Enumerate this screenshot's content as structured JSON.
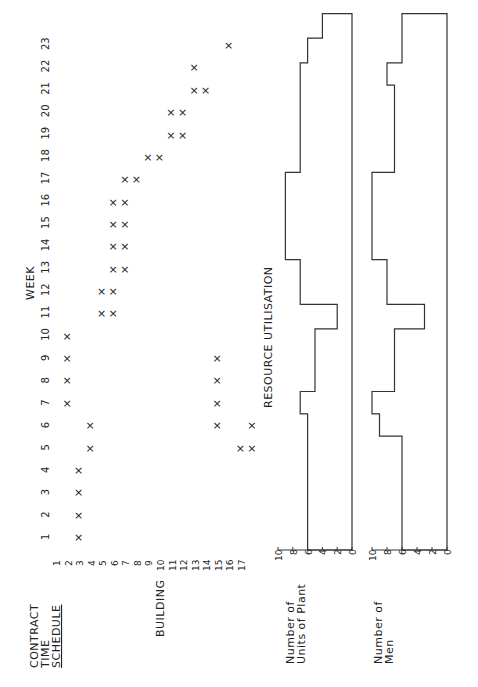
{
  "title_lines": [
    "CONTRACT",
    "TIME",
    "SCHEDULE"
  ],
  "building_label": "BUILDING",
  "week_label": "WEEK",
  "resource_label": "RESOURCE   UTILISATION",
  "plant_label_lines": [
    "Number of",
    "Units of Plant"
  ],
  "men_label_lines": [
    "Number of",
    "Men"
  ],
  "axis_ticks": [
    "10",
    "8",
    "6",
    "4",
    "2",
    "0"
  ],
  "chart_data": [
    {
      "type": "scatter",
      "title": "CONTRACT TIME SCHEDULE",
      "xlabel": "WEEK",
      "ylabel": "BUILDING",
      "x": [
        1,
        2,
        3,
        4,
        5,
        6,
        7,
        8,
        9,
        10,
        11,
        12,
        13,
        14,
        15,
        16,
        17,
        18,
        19,
        20,
        21,
        22,
        23
      ],
      "buildings": [
        1,
        2,
        3,
        4,
        5,
        6,
        7,
        8,
        9,
        10,
        11,
        12,
        13,
        14,
        15,
        16,
        17
      ],
      "marker": "x",
      "schedule": [
        {
          "week": 1,
          "buildings": [
            2
          ]
        },
        {
          "week": 2,
          "buildings": [
            2
          ]
        },
        {
          "week": 3,
          "buildings": [
            2
          ]
        },
        {
          "week": 4,
          "buildings": [
            2
          ]
        },
        {
          "week": 5,
          "buildings": [
            3,
            16,
            17
          ]
        },
        {
          "week": 6,
          "buildings": [
            3,
            14,
            17
          ]
        },
        {
          "week": 7,
          "buildings": [
            1,
            14
          ]
        },
        {
          "week": 8,
          "buildings": [
            1,
            14
          ]
        },
        {
          "week": 9,
          "buildings": [
            1,
            14
          ]
        },
        {
          "week": 10,
          "buildings": [
            1
          ]
        },
        {
          "week": 11,
          "buildings": [
            4,
            5
          ]
        },
        {
          "week": 12,
          "buildings": [
            4,
            5
          ]
        },
        {
          "week": 13,
          "buildings": [
            5,
            6
          ]
        },
        {
          "week": 14,
          "buildings": [
            5,
            6
          ]
        },
        {
          "week": 15,
          "buildings": [
            5,
            6
          ]
        },
        {
          "week": 16,
          "buildings": [
            5,
            6
          ]
        },
        {
          "week": 17,
          "buildings": [
            6,
            7
          ]
        },
        {
          "week": 18,
          "buildings": [
            8,
            9
          ]
        },
        {
          "week": 19,
          "buildings": [
            10,
            11
          ]
        },
        {
          "week": 20,
          "buildings": [
            10,
            11
          ]
        },
        {
          "week": 21,
          "buildings": [
            12,
            13
          ]
        },
        {
          "week": 22,
          "buildings": [
            12
          ]
        },
        {
          "week": 23,
          "buildings": [
            15
          ]
        }
      ]
    },
    {
      "type": "step",
      "title": "RESOURCE UTILISATION",
      "ylabel": "Number of Units of Plant",
      "ylim": [
        0,
        10
      ],
      "yticks": [
        0,
        2,
        4,
        6,
        8,
        10
      ],
      "segments": [
        {
          "from_week": 0.0,
          "to_week": 6.0,
          "value": 6
        },
        {
          "from_week": 6.0,
          "to_week": 7.0,
          "value": 7
        },
        {
          "from_week": 7.0,
          "to_week": 9.8,
          "value": 5
        },
        {
          "from_week": 9.8,
          "to_week": 10.9,
          "value": 2
        },
        {
          "from_week": 10.9,
          "to_week": 12.9,
          "value": 7
        },
        {
          "from_week": 12.9,
          "to_week": 16.8,
          "value": 9
        },
        {
          "from_week": 16.8,
          "to_week": 21.7,
          "value": 7
        },
        {
          "from_week": 21.7,
          "to_week": 22.8,
          "value": 6
        },
        {
          "from_week": 22.8,
          "to_week": 23.9,
          "value": 4
        }
      ]
    },
    {
      "type": "step",
      "ylabel": "Number of Men",
      "ylim": [
        0,
        10
      ],
      "yticks": [
        0,
        2,
        4,
        6,
        8,
        10
      ],
      "segments": [
        {
          "from_week": 0.0,
          "to_week": 5.0,
          "value": 6
        },
        {
          "from_week": 5.0,
          "to_week": 6.0,
          "value": 9
        },
        {
          "from_week": 6.0,
          "to_week": 7.0,
          "value": 10
        },
        {
          "from_week": 7.0,
          "to_week": 9.8,
          "value": 7
        },
        {
          "from_week": 9.8,
          "to_week": 10.9,
          "value": 3
        },
        {
          "from_week": 10.9,
          "to_week": 12.9,
          "value": 8
        },
        {
          "from_week": 12.9,
          "to_week": 16.8,
          "value": 10
        },
        {
          "from_week": 16.8,
          "to_week": 20.7,
          "value": 7
        },
        {
          "from_week": 20.7,
          "to_week": 21.7,
          "value": 8
        },
        {
          "from_week": 21.7,
          "to_week": 23.9,
          "value": 6
        }
      ]
    }
  ]
}
